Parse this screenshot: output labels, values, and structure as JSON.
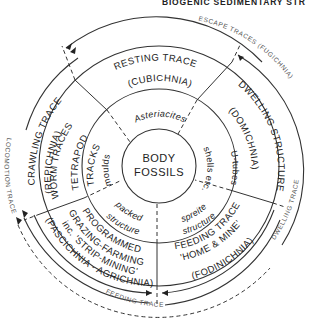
{
  "header": {
    "title": "BIOGENIC SEDIMENTARY STR"
  },
  "center": {
    "line1": "BODY",
    "line2": "FOSSILS"
  },
  "inner_ring": {
    "moulds": "moulds",
    "shells": "shells etc.",
    "packed": "packed",
    "packed_structure": "structure",
    "spreite": "spreite",
    "spreite_structure": "structure"
  },
  "middle_ring": {
    "asteriacites": "Asteriacites",
    "u_tubes": "U-tubes",
    "tetrapod_tracks_1": "TETRAPOD",
    "tetrapod_tracks_2": "TRACKS",
    "worm_traces": "WORM TRACES"
  },
  "outer_ring": {
    "resting_trace": "RESTING TRACE",
    "cubichnia": "(CUBICHNIA)",
    "dwelling_structure": "DWELLING STRUCTURE",
    "domichnia": "(DOMICHNIA)",
    "crawling_trace": "CRAWLING TRACE",
    "repichnia": "(REPICHNIA)",
    "feeding_trace": "FEEDING TRACE",
    "home_mine": "'HOME & MINE'",
    "fodinichnia": "(FODINICHNIA)",
    "programmed": "PROGRAMMED",
    "grazing_farming": "GRAZING-FARMING",
    "strip_mining": "inc. 'STRIP-MINING'",
    "pascichnia": "(PASCICHNIA - AGRICHNIA)"
  },
  "outer_arcs": {
    "escape": "ESCAPE TRACES (FUGICHNIA)",
    "locomotion": "LOCOMOTION TRACE",
    "dwelling": "DWELLING TRACE",
    "feeding": "FEEDING TRACE"
  }
}
